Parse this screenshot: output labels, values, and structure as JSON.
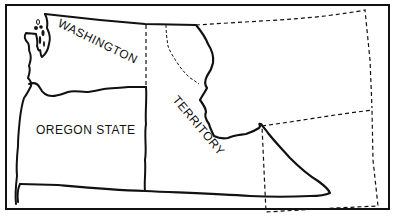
{
  "map": {
    "labels": {
      "washington": "WASHINGTON",
      "oregon": "OREGON STATE",
      "territory": "TERRITORY"
    },
    "colors": {
      "ink": "#111111",
      "background": "#ffffff"
    }
  }
}
